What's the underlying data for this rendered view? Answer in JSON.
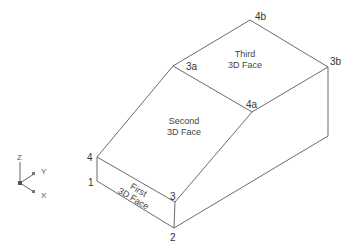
{
  "diagram": {
    "vertices": {
      "v4b": {
        "label": "4b"
      },
      "v3b": {
        "label": "3b"
      },
      "v3a": {
        "label": "3a"
      },
      "v4a": {
        "label": "4a"
      },
      "v4": {
        "label": "4"
      },
      "v1": {
        "label": "1"
      },
      "v3": {
        "label": "3"
      },
      "v2": {
        "label": "2"
      }
    },
    "faces": {
      "first": {
        "line1": "First",
        "line2": "3D Face"
      },
      "second": {
        "line1": "Second",
        "line2": "3D Face"
      },
      "third": {
        "line1": "Third",
        "line2": "3D Face"
      }
    },
    "ucs_icon": {
      "z": "Z",
      "y": "Y",
      "x": "X"
    }
  }
}
